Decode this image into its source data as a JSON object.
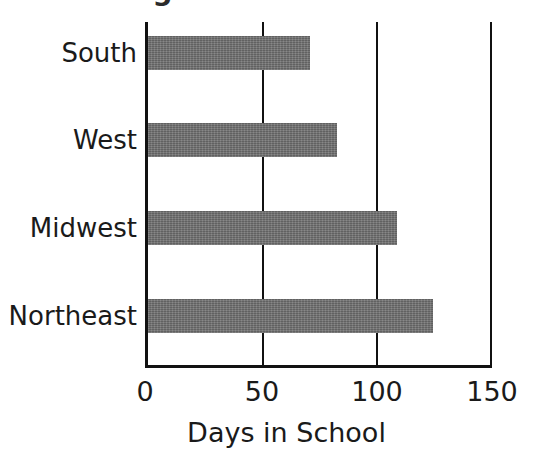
{
  "chart_data": {
    "type": "bar",
    "orientation": "horizontal",
    "title": "Region and Schools",
    "xlabel": "Days in School",
    "ylabel": "",
    "categories": [
      "South",
      "West",
      "Midwest",
      "Northeast"
    ],
    "values": [
      71,
      83,
      109,
      125
    ],
    "xlim": [
      0,
      150
    ],
    "xticks": [
      "0",
      "50",
      "100",
      "150"
    ],
    "xtick_values": [
      0,
      50,
      100,
      150
    ],
    "grid": true,
    "legend": null,
    "bar_color": "#6e6e6e",
    "axis_color": "#111111",
    "background": "#ffffff"
  }
}
